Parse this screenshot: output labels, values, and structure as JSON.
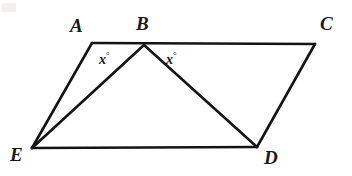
{
  "figure": {
    "kind": "geometry-diagram",
    "width": 352,
    "height": 176,
    "background_color": "#ffffff",
    "stroke_color": "#141414",
    "stroke_width": 2.6,
    "vertices": [
      {
        "id": "A",
        "label": "A",
        "x": 92,
        "y": 43,
        "label_x": 70,
        "label_y": 16
      },
      {
        "id": "B",
        "label": "B",
        "x": 144,
        "y": 45,
        "label_x": 136,
        "label_y": 14
      },
      {
        "id": "C",
        "label": "C",
        "x": 315,
        "y": 44,
        "label_x": 320,
        "label_y": 14
      },
      {
        "id": "D",
        "label": "D",
        "x": 257,
        "y": 147,
        "label_x": 264,
        "label_y": 148
      },
      {
        "id": "E",
        "label": "E",
        "x": 32,
        "y": 148,
        "label_x": 10,
        "label_y": 145
      }
    ],
    "segments": [
      {
        "id": "AC",
        "from": "A",
        "to": "C",
        "name": "segment-a-c"
      },
      {
        "id": "EA",
        "from": "E",
        "to": "A",
        "name": "segment-e-a"
      },
      {
        "id": "EB",
        "from": "E",
        "to": "B",
        "name": "segment-e-b"
      },
      {
        "id": "ED",
        "from": "E",
        "to": "D",
        "name": "segment-e-d"
      },
      {
        "id": "BD",
        "from": "B",
        "to": "D",
        "name": "segment-b-d"
      },
      {
        "id": "DC",
        "from": "D",
        "to": "C",
        "name": "segment-d-c"
      }
    ],
    "angle_labels": [
      {
        "id": "angle-abe",
        "text": "x",
        "unit": "°",
        "x": 99,
        "y": 51
      },
      {
        "id": "angle-dbc",
        "text": "x",
        "unit": "°",
        "x": 166,
        "y": 51
      }
    ]
  }
}
